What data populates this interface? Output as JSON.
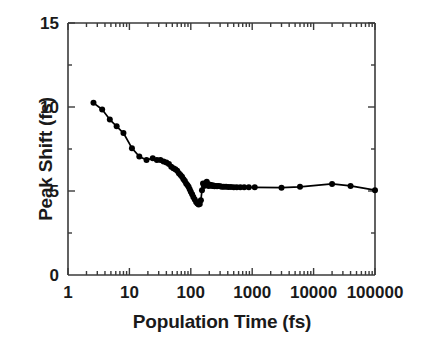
{
  "figure": {
    "background": "#ffffff",
    "ink_color": "#000000",
    "axis_color": "#3a3a3a"
  },
  "chart_data": {
    "type": "scatter",
    "title": "",
    "xlabel": "Population Time (fs)",
    "ylabel": "Peak Shift (fs)",
    "xscale": "log",
    "yscale": "linear",
    "xlim": [
      1,
      100000
    ],
    "ylim": [
      0,
      15
    ],
    "grid": false,
    "legend": null,
    "xticks": [
      1,
      10,
      100,
      1000,
      10000,
      100000
    ],
    "xtick_labels": [
      "1",
      "10",
      "100",
      "1000",
      "10000",
      "100000"
    ],
    "yticks": [
      0,
      5,
      10,
      15
    ],
    "ytick_labels": [
      "0",
      "5",
      "10",
      "15"
    ],
    "yminor_ticks": [
      2.5,
      7.5,
      12.5
    ],
    "tick_direction": "in",
    "marker": "filled-circle",
    "marker_size_px": 6,
    "line_style": "solid",
    "series": [
      {
        "name": "peak shift",
        "x": [
          2.6,
          3.6,
          4.8,
          6.2,
          8.0,
          11.0,
          14.5,
          19.0,
          24.0,
          28.0,
          32.0,
          36.0,
          40.0,
          44.0,
          48.0,
          52.0,
          56.0,
          60.0,
          64.0,
          68.0,
          72.0,
          76.0,
          80.0,
          84.0,
          88.0,
          92.0,
          96.0,
          100.0,
          105.0,
          110.0,
          116.0,
          122.0,
          128.0,
          134.0,
          140.0,
          146.0,
          152.0,
          158.0,
          164.0,
          170.0,
          176.0,
          182.0,
          188.0,
          194.0,
          200.0,
          208.0,
          216.0,
          224.0,
          234.0,
          244.0,
          256.0,
          268.0,
          282.0,
          300.0,
          320.0,
          345.0,
          375.0,
          410.0,
          450.0,
          500.0,
          560.0,
          640.0,
          740.0,
          880.0,
          1100.0,
          3000.0,
          6000.0,
          20000.0,
          40000.0,
          100000.0
        ],
        "y": [
          10.25,
          9.85,
          9.25,
          8.85,
          8.45,
          7.55,
          7.05,
          6.85,
          6.95,
          6.85,
          6.85,
          6.75,
          6.7,
          6.6,
          6.45,
          6.35,
          6.3,
          6.2,
          6.05,
          5.95,
          5.85,
          5.7,
          5.6,
          5.45,
          5.35,
          5.25,
          5.1,
          4.95,
          4.8,
          4.65,
          4.5,
          4.35,
          4.25,
          4.2,
          4.22,
          4.45,
          5.05,
          5.45,
          5.3,
          5.45,
          5.35,
          5.55,
          5.4,
          5.3,
          5.38,
          5.32,
          5.35,
          5.3,
          5.32,
          5.28,
          5.3,
          5.28,
          5.3,
          5.28,
          5.26,
          5.25,
          5.25,
          5.24,
          5.24,
          5.23,
          5.22,
          5.22,
          5.22,
          5.22,
          5.22,
          5.2,
          5.25,
          5.42,
          5.3,
          5.05
        ]
      }
    ]
  }
}
